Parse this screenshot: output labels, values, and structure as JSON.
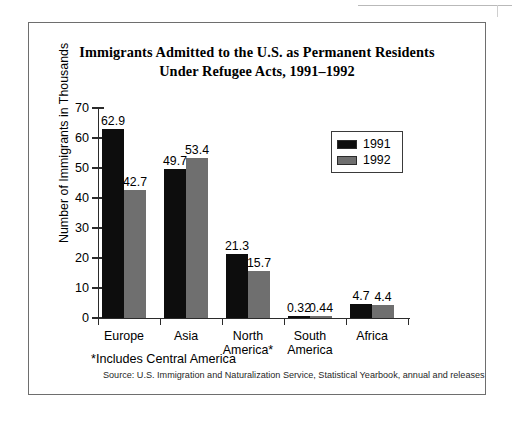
{
  "figure": {
    "title_line1": "Immigrants Admitted to the U.S. as Permanent Residents",
    "title_line2": "Under Refugee Acts, 1991–1992",
    "footnote": "*Includes Central America",
    "source": "Source: U.S. Immigration and Naturalization Service, Statistical Yearbook, annual and releases"
  },
  "chart_data": {
    "type": "bar",
    "title": "Immigrants Admitted to the U.S. as Permanent Residents Under Refugee Acts, 1991–1992",
    "xlabel": "",
    "ylabel": "Number of Immigrants in Thousands",
    "ylim": [
      0,
      70
    ],
    "ytick_labels": [
      "0",
      "10",
      "20",
      "30",
      "40",
      "50",
      "60",
      "70"
    ],
    "yticks": [
      0,
      10,
      20,
      30,
      40,
      50,
      60,
      70
    ],
    "grid": false,
    "legend_position": "upper-right-inside",
    "categories": [
      "Europe",
      "Asia",
      "North America*",
      "South America",
      "Africa"
    ],
    "category_lines": [
      [
        "Europe"
      ],
      [
        "Asia"
      ],
      [
        "North",
        "America*"
      ],
      [
        "South",
        "America"
      ],
      [
        "Africa"
      ]
    ],
    "series": [
      {
        "name": "1991",
        "color": "#0d0d0d",
        "values": [
          62.9,
          49.7,
          21.3,
          0.32,
          4.7
        ],
        "labels": [
          "62.9",
          "49.7",
          "21.3",
          "0.32",
          "4.7"
        ]
      },
      {
        "name": "1992",
        "color": "#6f6f6f",
        "values": [
          42.7,
          53.4,
          15.7,
          0.44,
          4.4
        ],
        "labels": [
          "42.7",
          "53.4",
          "15.7",
          "0.44",
          "4.4"
        ]
      }
    ]
  }
}
